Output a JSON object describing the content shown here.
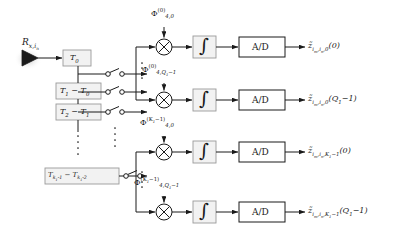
{
  "diagram": {
    "colors": {
      "stroke": "#1a1a1a",
      "box_fill": "#f2f2f2",
      "box_stroke": "#9a9a9a",
      "background": "#ffffff",
      "text": "#1a1a1a"
    },
    "source": {
      "label_html": "R<sub>x,i<sub>n</sub></sub>",
      "icon": "antenna-triangle-icon"
    },
    "delay_boxes": [
      {
        "id": "t0",
        "label_html": "T<sub>0</sub>"
      },
      {
        "id": "t1t0",
        "label_html": "T<sub>1</sub> &minus; T<sub>0</sub>"
      },
      {
        "id": "t2t1",
        "label_html": "T<sub>2</sub> &minus; T<sub>1</sub>"
      },
      {
        "id": "tklast",
        "label_html": "T<sub>k<sub>1</sub>-1</sub> &minus; T<sub>k<sub>1</sub>-2</sub>"
      }
    ],
    "switches": [
      {
        "id": "sw-0",
        "name": "switch-row-0"
      },
      {
        "id": "sw-1",
        "name": "switch-row-1"
      },
      {
        "id": "sw-2",
        "name": "switch-row-2"
      },
      {
        "id": "sw-3",
        "name": "switch-row-3"
      }
    ],
    "phase_labels": [
      {
        "id": "phi-0",
        "label_html": "&Phi;<sup>(0)</sup><sub>4,0</sub>"
      },
      {
        "id": "phi-1",
        "label_html": "&Phi;<sup>(0)</sup><sub>4,Q<sub>1</sub>&minus;1</sub>"
      },
      {
        "id": "phi-2",
        "label_html": "&Phi;<sup>(K<sub>1</sub>&minus;1)</sup><sub>4,0</sub>"
      },
      {
        "id": "phi-3",
        "label_html": "&Phi;<sup>(K<sub>1</sub>&minus;1)</sup><sub>4,Q<sub>1</sub>&minus;1</sub>"
      }
    ],
    "mixers": [
      {
        "id": "mix-0",
        "symbol": "multiplier-circle-x"
      },
      {
        "id": "mix-1",
        "symbol": "multiplier-circle-x"
      },
      {
        "id": "mix-2",
        "symbol": "multiplier-circle-x"
      },
      {
        "id": "mix-3",
        "symbol": "multiplier-circle-x"
      }
    ],
    "integrators": [
      {
        "id": "int-0",
        "symbol": "∫"
      },
      {
        "id": "int-1",
        "symbol": "∫"
      },
      {
        "id": "int-2",
        "symbol": "∫"
      },
      {
        "id": "int-3",
        "symbol": "∫"
      }
    ],
    "adc_boxes": [
      {
        "id": "ad-0",
        "label": "A/D"
      },
      {
        "id": "ad-1",
        "label": "A/D"
      },
      {
        "id": "ad-2",
        "label": "A/D"
      },
      {
        "id": "ad-3",
        "label": "A/D"
      }
    ],
    "outputs": [
      {
        "id": "out-0",
        "label_html": "z&#771;<sub>i<sub>m</sub>,i<sub>n</sub>,0</sub>(0)"
      },
      {
        "id": "out-1",
        "label_html": "z&#771;<sub>i<sub>m</sub>,i<sub>n</sub>,0</sub>(Q<sub>1</sub>&minus;1)"
      },
      {
        "id": "out-2",
        "label_html": "z&#771;<sub>i<sub>m</sub>,i<sub>n</sub>,K<sub>1</sub>&minus;1</sub>(0)"
      },
      {
        "id": "out-3",
        "label_html": "z&#771;<sub>i<sub>m</sub>,i<sub>n</sub>,K<sub>1</sub>&minus;1</sub>(Q<sub>1</sub>&minus;1)"
      }
    ],
    "ellipses": [
      {
        "id": "ell-delay-chain",
        "orientation": "vertical",
        "name": "vertical-dots-delay-chain"
      },
      {
        "id": "ell-bus-top",
        "orientation": "vertical",
        "name": "vertical-dots-branch-top"
      },
      {
        "id": "ell-bus-bottom",
        "orientation": "vertical",
        "name": "vertical-dots-branch-bottom"
      },
      {
        "id": "ell-mid-stack",
        "orientation": "vertical",
        "name": "vertical-dots-middle-stack"
      }
    ]
  }
}
